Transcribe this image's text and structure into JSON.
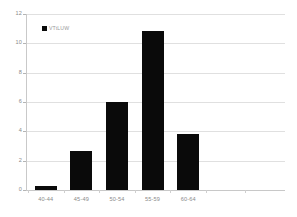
{
  "chart_data": {
    "type": "bar",
    "title": "",
    "subtitle": "",
    "xlabel": "",
    "ylabel": "",
    "categories": [
      "40-44",
      "45-49",
      "50-54",
      "55-59",
      "60-64"
    ],
    "values": [
      0.3,
      2.65,
      6.0,
      10.85,
      3.8
    ],
    "series": [
      {
        "name": "VTtLUW",
        "values": [
          0.3,
          2.65,
          6.0,
          10.85,
          3.8
        ],
        "color": "#0a0a0a"
      }
    ],
    "ylim": [
      0,
      12
    ],
    "ytick_values": [
      12,
      10,
      8,
      6,
      4,
      2,
      0
    ],
    "ytick_labels": [
      "12",
      "10",
      "8",
      "6",
      "4",
      "2",
      "0"
    ],
    "xtick_labels": [
      "40-44",
      "45-49",
      "50-54",
      "55-59",
      "60-64"
    ],
    "grid": true,
    "grid_axis": "y",
    "legend": {
      "position": "top-left-inside",
      "entries": [
        {
          "label": "VTtLUW",
          "marker": "square",
          "color": "#0a0a0a"
        }
      ]
    },
    "colors": {
      "bar": "#0a0a0a",
      "gridline": "#e0e0e0",
      "axis": "#c9c9c9",
      "tick_text": "#8a8a8a",
      "background": "#ffffff"
    }
  }
}
